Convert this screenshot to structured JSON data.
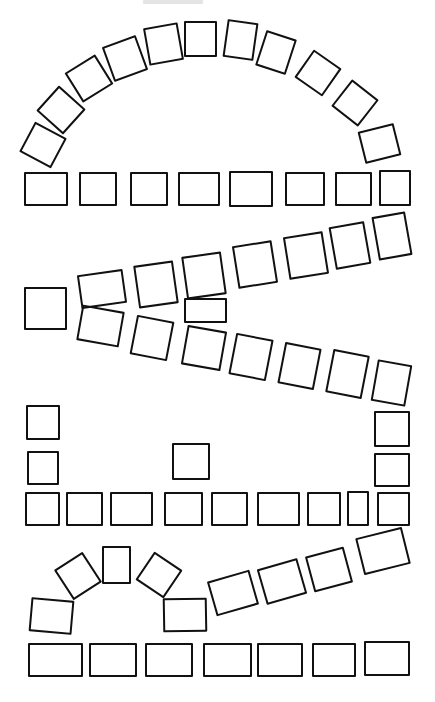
{
  "diagram": {
    "stroke_color": "#111111",
    "background": "#ffffff",
    "sections": [
      {
        "name": "top-arc",
        "cells": [
          {
            "cx": 43,
            "cy": 145,
            "w": 36,
            "h": 34,
            "rot": 28
          },
          {
            "cx": 61,
            "cy": 110,
            "w": 36,
            "h": 34,
            "rot": 42
          },
          {
            "cx": 89,
            "cy": 78,
            "w": 36,
            "h": 35,
            "rot": -32
          },
          {
            "cx": 125,
            "cy": 58,
            "w": 36,
            "h": 37,
            "rot": -20
          },
          {
            "cx": 163,
            "cy": 44,
            "w": 35,
            "h": 38,
            "rot": -10
          },
          {
            "cx": 200,
            "cy": 39,
            "w": 33,
            "h": 36,
            "rot": 0
          },
          {
            "cx": 240,
            "cy": 40,
            "w": 31,
            "h": 38,
            "rot": 8
          },
          {
            "cx": 276,
            "cy": 52,
            "w": 32,
            "h": 37,
            "rot": 18
          },
          {
            "cx": 318,
            "cy": 73,
            "w": 34,
            "h": 34,
            "rot": 35
          },
          {
            "cx": 355,
            "cy": 103,
            "w": 34,
            "h": 34,
            "rot": 38
          },
          {
            "cx": 379,
            "cy": 143,
            "w": 37,
            "h": 33,
            "rot": -14
          }
        ]
      },
      {
        "name": "row-1",
        "cells": [
          {
            "x": 24,
            "y": 172,
            "w": 44,
            "h": 34
          },
          {
            "x": 79,
            "y": 172,
            "w": 38,
            "h": 34
          },
          {
            "x": 130,
            "y": 172,
            "w": 38,
            "h": 34
          },
          {
            "x": 178,
            "y": 172,
            "w": 42,
            "h": 34
          },
          {
            "x": 229,
            "y": 171,
            "w": 44,
            "h": 36
          },
          {
            "x": 285,
            "y": 172,
            "w": 40,
            "h": 34
          },
          {
            "x": 335,
            "y": 172,
            "w": 37,
            "h": 34
          },
          {
            "x": 379,
            "y": 170,
            "w": 32,
            "h": 36
          }
        ]
      },
      {
        "name": "left-single",
        "cells": [
          {
            "x": 24,
            "y": 287,
            "w": 43,
            "h": 43
          }
        ]
      },
      {
        "name": "upper-diagonal",
        "cells": [
          {
            "cx": 102,
            "cy": 289,
            "w": 46,
            "h": 34,
            "rot": -8
          },
          {
            "cx": 156,
            "cy": 284,
            "w": 40,
            "h": 43,
            "rot": -8
          },
          {
            "cx": 204,
            "cy": 275,
            "w": 40,
            "h": 43,
            "rot": -8
          },
          {
            "cx": 255,
            "cy": 264,
            "w": 40,
            "h": 43,
            "rot": -9
          },
          {
            "cx": 306,
            "cy": 255,
            "w": 40,
            "h": 43,
            "rot": -9
          },
          {
            "cx": 350,
            "cy": 245,
            "w": 36,
            "h": 43,
            "rot": -10
          },
          {
            "cx": 392,
            "cy": 236,
            "w": 34,
            "h": 44,
            "rot": -10
          }
        ]
      },
      {
        "name": "wedge",
        "cells": [
          {
            "x": 184,
            "y": 298,
            "w": 43,
            "h": 25
          }
        ]
      },
      {
        "name": "lower-diagonal",
        "cells": [
          {
            "cx": 100,
            "cy": 326,
            "w": 43,
            "h": 36,
            "rot": 10
          },
          {
            "cx": 152,
            "cy": 338,
            "w": 38,
            "h": 40,
            "rot": 11
          },
          {
            "cx": 204,
            "cy": 348,
            "w": 40,
            "h": 40,
            "rot": 10
          },
          {
            "cx": 251,
            "cy": 357,
            "w": 38,
            "h": 42,
            "rot": 11
          },
          {
            "cx": 299,
            "cy": 366,
            "w": 37,
            "h": 42,
            "rot": 11
          },
          {
            "cx": 347,
            "cy": 374,
            "w": 37,
            "h": 44,
            "rot": 11
          },
          {
            "cx": 391,
            "cy": 383,
            "w": 35,
            "h": 42,
            "rot": 10
          }
        ]
      },
      {
        "name": "left-column",
        "cells": [
          {
            "x": 26,
            "y": 405,
            "w": 34,
            "h": 35
          },
          {
            "x": 27,
            "y": 451,
            "w": 32,
            "h": 34
          }
        ]
      },
      {
        "name": "center-single",
        "cells": [
          {
            "x": 172,
            "y": 443,
            "w": 38,
            "h": 37
          }
        ]
      },
      {
        "name": "right-column",
        "cells": [
          {
            "x": 374,
            "y": 411,
            "w": 36,
            "h": 36
          },
          {
            "x": 374,
            "y": 453,
            "w": 36,
            "h": 34
          }
        ]
      },
      {
        "name": "row-2",
        "cells": [
          {
            "x": 25,
            "y": 492,
            "w": 35,
            "h": 34
          },
          {
            "x": 66,
            "y": 492,
            "w": 37,
            "h": 34
          },
          {
            "x": 110,
            "y": 492,
            "w": 43,
            "h": 34
          },
          {
            "x": 164,
            "y": 492,
            "w": 39,
            "h": 34
          },
          {
            "x": 211,
            "y": 492,
            "w": 37,
            "h": 34
          },
          {
            "x": 257,
            "y": 492,
            "w": 43,
            "h": 34
          },
          {
            "x": 307,
            "y": 492,
            "w": 34,
            "h": 34
          },
          {
            "x": 347,
            "y": 491,
            "w": 22,
            "h": 35
          },
          {
            "x": 377,
            "y": 492,
            "w": 33,
            "h": 34
          }
        ]
      },
      {
        "name": "small-arch",
        "cells": [
          {
            "cx": 51,
            "cy": 616,
            "w": 43,
            "h": 34,
            "rot": 5
          },
          {
            "cx": 78,
            "cy": 576,
            "w": 34,
            "h": 36,
            "rot": -33
          },
          {
            "cx": 116,
            "cy": 565,
            "w": 29,
            "h": 38,
            "rot": 0
          },
          {
            "cx": 159,
            "cy": 575,
            "w": 34,
            "h": 34,
            "rot": 34
          },
          {
            "cx": 185,
            "cy": 615,
            "w": 44,
            "h": 34,
            "rot": -1
          }
        ]
      },
      {
        "name": "rising-row",
        "cells": [
          {
            "cx": 233,
            "cy": 593,
            "w": 44,
            "h": 36,
            "rot": -16
          },
          {
            "cx": 282,
            "cy": 581,
            "w": 42,
            "h": 37,
            "rot": -16
          },
          {
            "cx": 329,
            "cy": 569,
            "w": 40,
            "h": 37,
            "rot": -15
          },
          {
            "cx": 383,
            "cy": 551,
            "w": 48,
            "h": 38,
            "rot": -14
          }
        ]
      },
      {
        "name": "bottom-row",
        "cells": [
          {
            "x": 28,
            "y": 643,
            "w": 55,
            "h": 34
          },
          {
            "x": 89,
            "y": 643,
            "w": 48,
            "h": 34
          },
          {
            "x": 145,
            "y": 643,
            "w": 48,
            "h": 34
          },
          {
            "x": 203,
            "y": 643,
            "w": 49,
            "h": 34
          },
          {
            "x": 257,
            "y": 643,
            "w": 46,
            "h": 34
          },
          {
            "x": 312,
            "y": 643,
            "w": 44,
            "h": 34
          },
          {
            "x": 364,
            "y": 641,
            "w": 46,
            "h": 35
          }
        ]
      }
    ]
  }
}
